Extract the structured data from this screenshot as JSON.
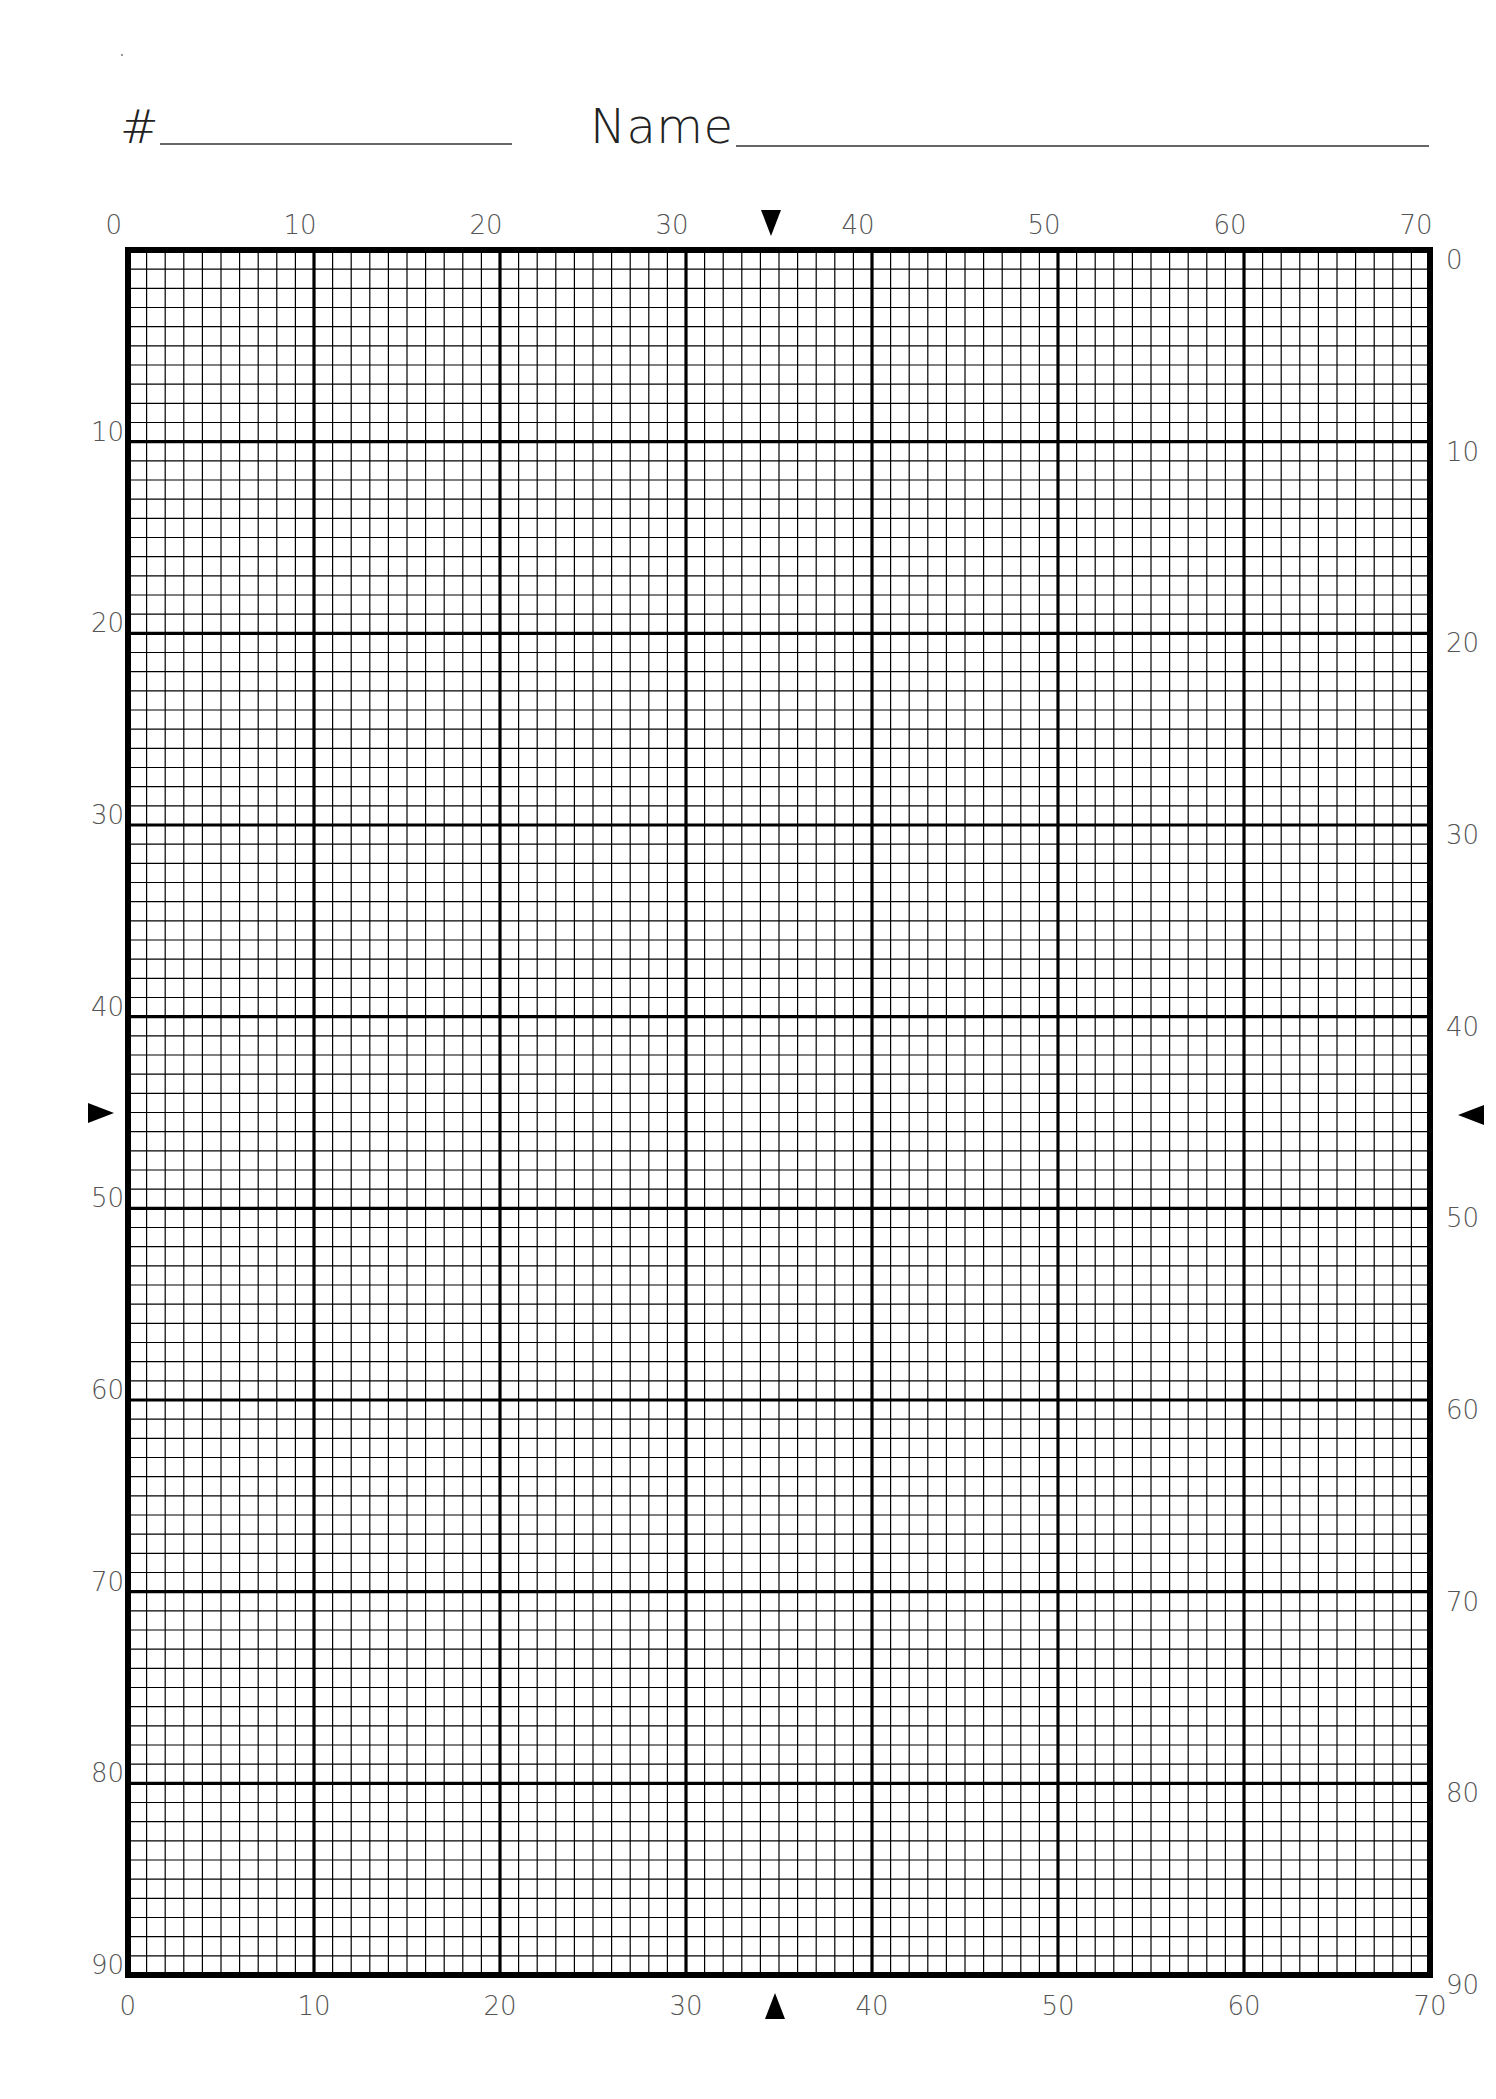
{
  "header": {
    "number_label": "#",
    "number_value": "",
    "name_label": "Name",
    "name_value": ""
  },
  "grid": {
    "columns": 70,
    "rows": 90,
    "major_every": 10,
    "line_color": "#000000",
    "top_ticks": [
      "0",
      "10",
      "20",
      "30",
      "40",
      "50",
      "60",
      "70"
    ],
    "bottom_ticks": [
      "0",
      "10",
      "20",
      "30",
      "40",
      "50",
      "60",
      "70"
    ],
    "left_ticks": [
      "10",
      "20",
      "30",
      "40",
      "50",
      "60",
      "70",
      "80",
      "90"
    ],
    "right_ticks": [
      "0",
      "10",
      "20",
      "30",
      "40",
      "50",
      "60",
      "70",
      "80",
      "90"
    ],
    "center_markers": {
      "top_column": 35,
      "bottom_column": 35,
      "left_row": 45,
      "right_row": 45
    }
  }
}
